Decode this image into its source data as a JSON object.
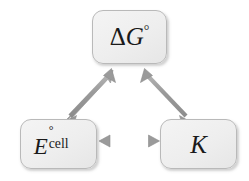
{
  "figure": {
    "name": "thermodynamic-electrochemical-relationship-triangle",
    "background_color": "#ffffff"
  },
  "nodes": [
    {
      "id": "delta-g-standard",
      "symbol_main": "ΔG",
      "symbol_superscript": "°",
      "symbol_subscript": "",
      "plain_text": "ΔG°",
      "fill_color": "#eeeeee",
      "border_color": "#b9b9b9",
      "text_color": "#1a1a1a"
    },
    {
      "id": "standard-cell-potential",
      "symbol_main": "E",
      "symbol_superscript": "°",
      "symbol_subscript": "cell",
      "plain_text": "E°cell",
      "fill_color": "#eeeeee",
      "border_color": "#b9b9b9",
      "text_color": "#1a1a1a"
    },
    {
      "id": "equilibrium-constant",
      "symbol_main": "K",
      "symbol_superscript": "",
      "symbol_subscript": "",
      "plain_text": "K",
      "fill_color": "#eeeeee",
      "border_color": "#b9b9b9",
      "text_color": "#1a1a1a"
    }
  ],
  "connectors": [
    {
      "id": "arrow-ecell-to-deltag",
      "from": "standard-cell-potential",
      "to": "delta-g-standard",
      "style": "double-headed",
      "color": "#9a9a9a"
    },
    {
      "id": "arrow-deltag-to-k",
      "from": "delta-g-standard",
      "to": "equilibrium-constant",
      "style": "double-headed",
      "color": "#9a9a9a"
    },
    {
      "id": "arrow-ecell-to-k",
      "from": "standard-cell-potential",
      "to": "equilibrium-constant",
      "style": "double-headed",
      "color": "#9a9a9a"
    }
  ]
}
